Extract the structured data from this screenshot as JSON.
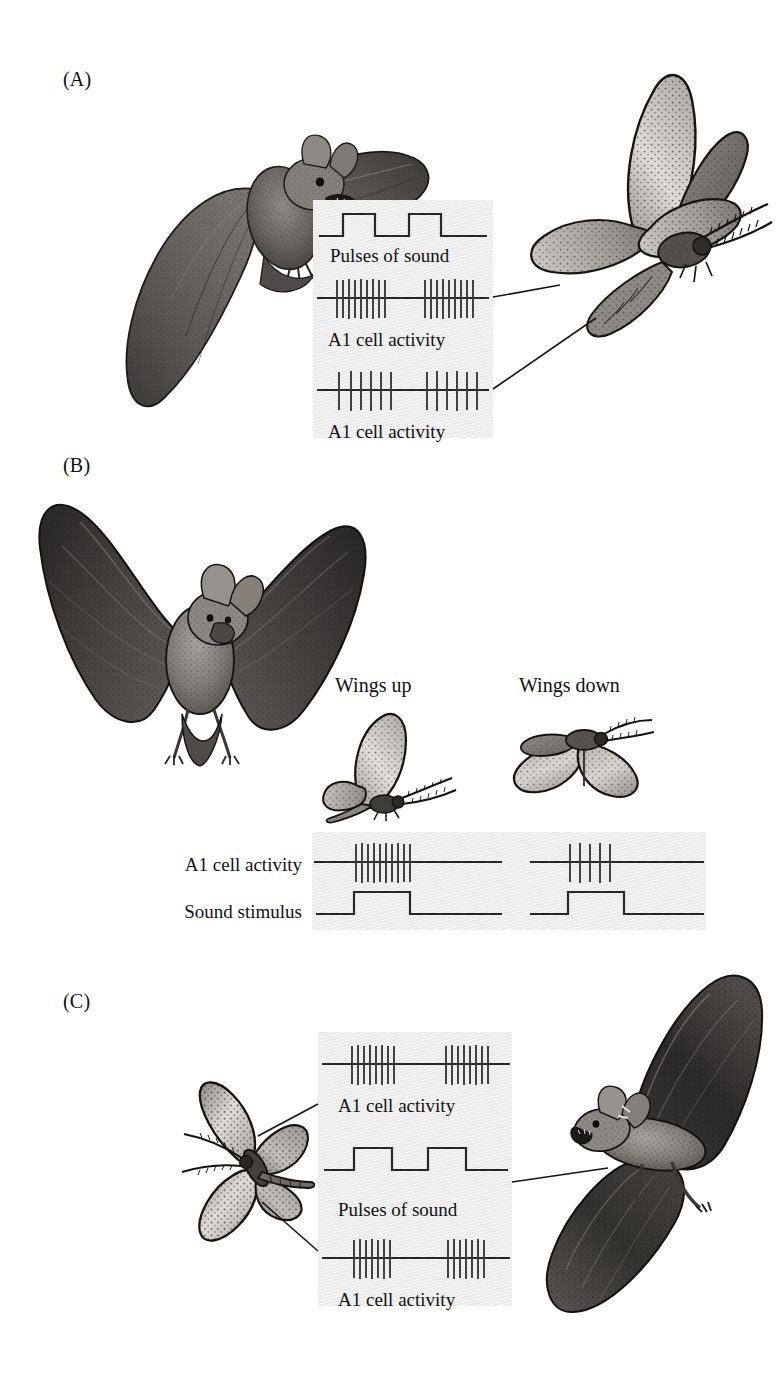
{
  "figure": {
    "background_color": "#ffffff",
    "trace_box_color": "#ececec",
    "ink_color": "#121212"
  },
  "panels": [
    {
      "id": "A",
      "label": "(A)",
      "description": "Bat approaching a moth at close range; two A1 receptor cells fire bursts in time with the bat's sound pulses",
      "traces": [
        {
          "name": "pulses-of-sound",
          "caption": "Pulses of sound",
          "type": "square-pulse",
          "pulses": 2,
          "bursts": 0,
          "spikes_per_burst": 0
        },
        {
          "name": "a1-cell-activity-upper",
          "caption": "A1 cell activity",
          "type": "spike-train",
          "pulses": 0,
          "bursts": 2,
          "spikes_per_burst": 9
        },
        {
          "name": "a1-cell-activity-lower",
          "caption": "A1 cell activity",
          "type": "spike-train",
          "pulses": 0,
          "bursts": 2,
          "spikes_per_burst": 6
        }
      ],
      "artwork": [
        {
          "name": "bat-illustration-a",
          "kind": "bat",
          "pose": "diving-toward-viewer"
        },
        {
          "name": "moth-illustration-a",
          "kind": "moth",
          "pose": "wings-raised-side-view"
        }
      ],
      "leaders": 2
    },
    {
      "id": "B",
      "label": "(B)",
      "description": "Flying bat; moth wing position alters the loudness reaching the A1 cell",
      "moth_captions": [
        {
          "name": "wings-up-caption",
          "text": "Wings up"
        },
        {
          "name": "wings-down-caption",
          "text": "Wings down"
        }
      ],
      "row_labels": [
        {
          "name": "a1-cell-activity-label",
          "text": "A1 cell activity"
        },
        {
          "name": "sound-stimulus-label",
          "text": "Sound stimulus"
        }
      ],
      "traces": [
        {
          "name": "a1-cell-activity-wings-up",
          "caption": "",
          "type": "spike-train",
          "bursts": 1,
          "spikes_per_burst": 10,
          "condition": "Wings up"
        },
        {
          "name": "a1-cell-activity-wings-down",
          "caption": "",
          "type": "spike-train",
          "bursts": 1,
          "spikes_per_burst": 5,
          "condition": "Wings down"
        },
        {
          "name": "sound-stimulus-wings-up",
          "caption": "",
          "type": "square-pulse",
          "pulses": 1,
          "condition": "Wings up"
        },
        {
          "name": "sound-stimulus-wings-down",
          "caption": "",
          "type": "square-pulse",
          "pulses": 1,
          "condition": "Wings down"
        }
      ],
      "artwork": [
        {
          "name": "bat-illustration-b",
          "kind": "bat",
          "pose": "wings-spread-front-view"
        },
        {
          "name": "moth-illustration-wings-up",
          "kind": "moth",
          "pose": "wings-up"
        },
        {
          "name": "moth-illustration-wings-down",
          "kind": "moth",
          "pose": "wings-down"
        }
      ]
    },
    {
      "id": "C",
      "label": "(C)",
      "description": "Bat at a distance to the moth's right; the nearer A1 cell fires more strongly than the far one",
      "traces": [
        {
          "name": "a1-cell-activity-upper",
          "caption": "A1 cell activity",
          "type": "spike-train",
          "bursts": 2,
          "spikes_per_burst": 8
        },
        {
          "name": "pulses-of-sound",
          "caption": "Pulses of sound",
          "type": "square-pulse",
          "pulses": 2
        },
        {
          "name": "a1-cell-activity-lower",
          "caption": "A1 cell activity",
          "type": "spike-train",
          "bursts": 2,
          "spikes_per_burst": 7
        }
      ],
      "artwork": [
        {
          "name": "moth-illustration-c",
          "kind": "moth",
          "pose": "wings-spread-top-view"
        },
        {
          "name": "bat-illustration-c",
          "kind": "bat",
          "pose": "gliding-side-view"
        }
      ],
      "leaders": 3
    }
  ]
}
